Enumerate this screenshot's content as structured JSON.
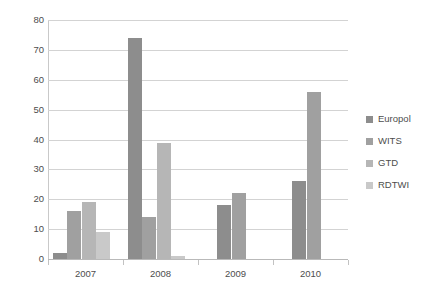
{
  "chart_data": {
    "type": "bar",
    "title": "",
    "subtitle": "",
    "xlabel": "",
    "ylabel": "",
    "categories": [
      "2007",
      "2008",
      "2009",
      "2010"
    ],
    "series": [
      {
        "name": "Europol",
        "color": "#8d8d8d",
        "values": [
          2,
          74,
          18,
          26
        ]
      },
      {
        "name": "WITS",
        "color": "#a0a0a0",
        "values": [
          16,
          14,
          22,
          56
        ]
      },
      {
        "name": "GTD",
        "color": "#b6b6b6",
        "values": [
          19,
          39,
          null,
          null
        ]
      },
      {
        "name": "RDTWI",
        "color": "#c9c9c9",
        "values": [
          9,
          1,
          null,
          null
        ]
      }
    ],
    "ylim": [
      0,
      80
    ],
    "yticks": [
      0,
      10,
      20,
      30,
      40,
      50,
      60,
      70,
      80
    ],
    "ytick_labels": [
      "0",
      "10",
      "20",
      "30",
      "40",
      "50",
      "60",
      "70",
      "80"
    ],
    "grid": true,
    "grid_axis": "y",
    "legend_position": "right",
    "legend_entries": [
      "Europol",
      "WITS",
      "GTD",
      "RDTWI"
    ],
    "background": "#ffffff",
    "grid_color": "#d3d3d3",
    "text_color": "#4d4d4d"
  }
}
